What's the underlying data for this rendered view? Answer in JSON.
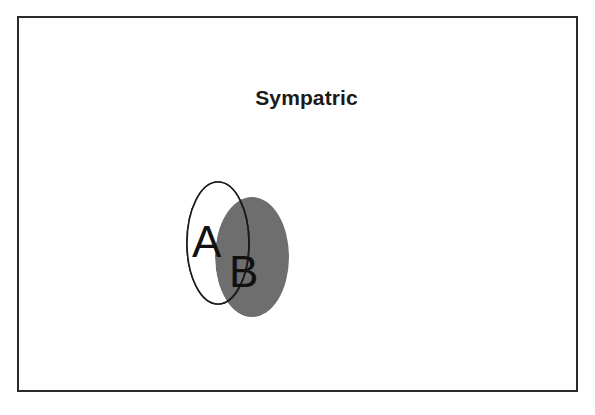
{
  "figure": {
    "title": "Sympatric",
    "background_color": "#ffffff",
    "frame_color": "#2b2b2b",
    "frame_border_width": 2
  },
  "venn": {
    "type": "venn-2-overlapping",
    "sets": [
      {
        "id": "A",
        "label": "A",
        "fill": "#ffffff",
        "stroke": "#1a1a1a",
        "stroke_width": 1.6,
        "cx": 48,
        "cy": 68,
        "rx": 31,
        "ry": 61,
        "label_x": 22,
        "label_y": 82,
        "label_size": 44
      },
      {
        "id": "B",
        "label": "B",
        "fill": "#6e6e6e",
        "stroke": "#6e6e6e",
        "stroke_width": 0,
        "cx": 82,
        "cy": 82,
        "rx": 37,
        "ry": 60,
        "label_x": 59,
        "label_y": 112,
        "label_size": 44
      }
    ],
    "overlap_description": "set A and set B ranges overlap"
  }
}
